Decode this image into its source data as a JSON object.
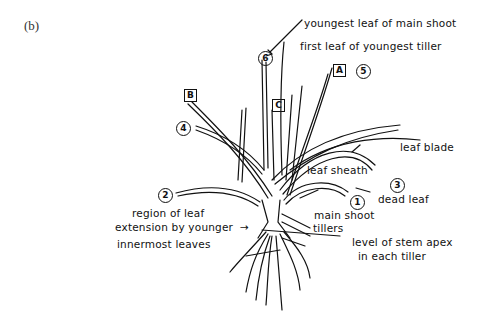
{
  "figure": {
    "panel_label": "(b)",
    "labels": {
      "youngest_leaf": "youngest leaf of main shoot",
      "first_leaf_tiller": "first leaf of youngest tiller",
      "leaf_blade": "leaf blade",
      "leaf_sheath": "leaf sheath",
      "dead_leaf": "dead leaf",
      "main_shoot": "main shoot",
      "tillers": "tillers",
      "region_line1": "region of leaf",
      "region_line2": "extension by younger",
      "region_arrow": "→",
      "innermost": "innermost leaves",
      "stem_apex_line1": "level of stem apex",
      "stem_apex_line2": "in each tiller"
    },
    "leaf_numbers": [
      "1",
      "2",
      "3",
      "4",
      "5",
      "6"
    ],
    "tiller_markers": [
      "A",
      "B",
      "C"
    ]
  }
}
